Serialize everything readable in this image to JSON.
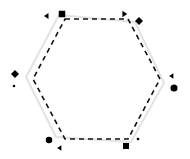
{
  "figure": {
    "width": 190,
    "height": 159,
    "background_color": "#ffffff"
  },
  "chart_data": {
    "type": "scatter",
    "title": "",
    "subtitle": "",
    "xlabel": "",
    "ylabel": "",
    "xlim": [
      0,
      190
    ],
    "ylim": [
      0,
      159
    ],
    "grid": false,
    "legend": "none",
    "annotations": [],
    "tick_labels": {
      "x": [],
      "y": []
    },
    "shapes": [
      {
        "name": "dashed-hexagon",
        "kind": "polygon",
        "stroke": "#111111",
        "stroke_width": 1.6,
        "dash": "5 4",
        "fill": "none",
        "points": [
          [
            65,
            19
          ],
          [
            128,
            19
          ],
          [
            160,
            79
          ],
          [
            128,
            139
          ],
          [
            65,
            139
          ],
          [
            33,
            79
          ]
        ]
      },
      {
        "name": "gray-hexagon",
        "kind": "polygon",
        "stroke": "#e2e2e2",
        "stroke_width": 2.0,
        "dash": "none",
        "fill": "none",
        "points": [
          [
            59,
            15
          ],
          [
            135,
            22
          ],
          [
            164,
            83
          ],
          [
            131,
            142
          ],
          [
            56,
            137
          ],
          [
            26,
            77
          ]
        ]
      }
    ],
    "series": [
      {
        "name": "large-markers",
        "marker": "square",
        "color": "#000000",
        "size": 6,
        "points": [
          {
            "label": "top-left-vertex",
            "marker": "square",
            "size": 6.5,
            "x": 62,
            "y": 14
          },
          {
            "label": "top-right-vertex",
            "marker": "diamond",
            "size": 7.0,
            "x": 139,
            "y": 21
          },
          {
            "label": "left-vertex",
            "marker": "diamond",
            "size": 7.0,
            "x": 15,
            "y": 74
          },
          {
            "label": "right-vertex",
            "marker": "circle",
            "size": 7.0,
            "x": 174,
            "y": 88
          },
          {
            "label": "bottom-left-vertex",
            "marker": "circle",
            "size": 6.5,
            "x": 49,
            "y": 140
          },
          {
            "label": "bottom-right-vertex",
            "marker": "square",
            "size": 6.0,
            "x": 126,
            "y": 146
          }
        ]
      },
      {
        "name": "small-markers",
        "marker": "triangle",
        "color": "#000000",
        "size": 3,
        "points": [
          {
            "label": "top-left-small",
            "marker": "triangle-left",
            "size": 3.0,
            "x": 47,
            "y": 16
          },
          {
            "label": "top-right-small",
            "marker": "triangle-right",
            "size": 3.2,
            "x": 124,
            "y": 14
          },
          {
            "label": "left-lower-small",
            "marker": "circle",
            "size": 2.6,
            "x": 14,
            "y": 86
          },
          {
            "label": "right-upper-small",
            "marker": "triangle-left",
            "size": 2.8,
            "x": 172,
            "y": 76
          },
          {
            "label": "bottom-left-small",
            "marker": "triangle-left",
            "size": 2.8,
            "x": 60,
            "y": 148
          },
          {
            "label": "bottom-right-small",
            "marker": "circle",
            "size": 2.6,
            "x": 138,
            "y": 139
          }
        ]
      }
    ]
  }
}
